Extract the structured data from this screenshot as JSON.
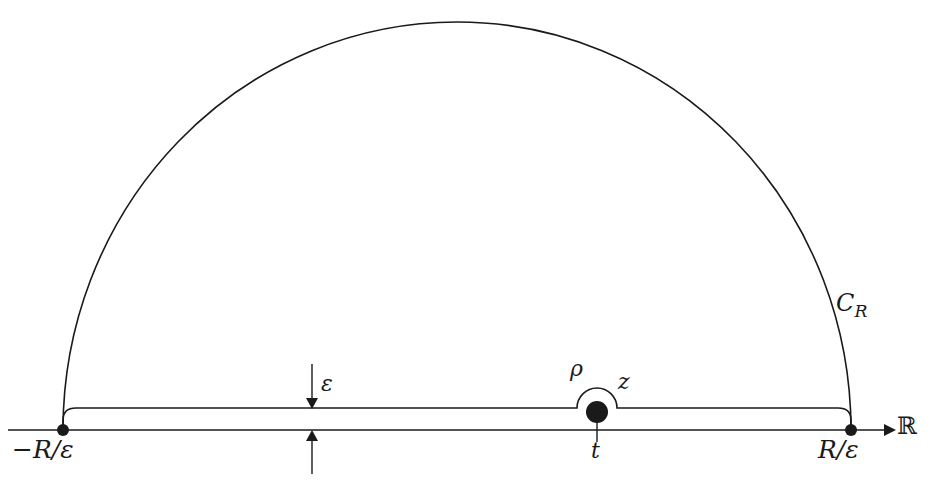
{
  "figure": {
    "kind": "contour-integration-diagram",
    "background_color": "#ffffff",
    "stroke_color": "#1a1a1a"
  },
  "labels": {
    "left_endpoint": "−R/ε",
    "right_endpoint": "R/ε",
    "arc_name": "C",
    "arc_subscript": "R",
    "epsilon": "ε",
    "rho": "ρ",
    "z": "z",
    "pole": "t",
    "real_axis": "ℝ"
  },
  "geometry": {
    "real_axis": {
      "y": 430,
      "x_start": 8,
      "x_end": 890,
      "arrow": "right"
    },
    "left_endpoint_dot": {
      "x": 63,
      "y": 430,
      "r": 6
    },
    "right_endpoint_dot": {
      "x": 851,
      "y": 430,
      "r": 6
    },
    "pole_dot": {
      "x": 597,
      "y": 412,
      "r": 11
    },
    "big_arc": {
      "cx": 457,
      "cy": 430,
      "rx": 394,
      "ry": 408
    },
    "inner_contour_y": 408,
    "small_semicircle": {
      "cx": 597,
      "cy": 408,
      "r": 20
    },
    "epsilon_arrow_x": 312,
    "epsilon_gap": {
      "top": 408,
      "bottom": 430
    }
  }
}
